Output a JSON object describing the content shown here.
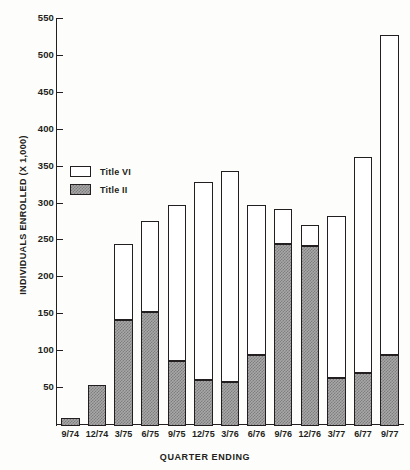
{
  "chart_data": {
    "type": "bar",
    "stacked": true,
    "title": "",
    "xlabel": "QUARTER ENDING",
    "ylabel": "INDIVIDUALS ENROLLED (X 1,000)",
    "ylim": [
      0,
      550
    ],
    "ytick_step": 50,
    "yticks": [
      0,
      50,
      100,
      150,
      200,
      250,
      300,
      350,
      400,
      450,
      500,
      550
    ],
    "ytick_labels": [
      "0",
      "50",
      "100",
      "150",
      "200",
      "250",
      "300",
      "350",
      "400",
      "450",
      "500",
      "550"
    ],
    "grid": false,
    "legend_position": "upper-left-inside",
    "categories": [
      "9/74",
      "12/74",
      "3/75",
      "6/75",
      "9/75",
      "12/75",
      "3/76",
      "6/76",
      "9/76",
      "12/76",
      "3/77",
      "6/77",
      "9/77"
    ],
    "series": [
      {
        "name": "Title II",
        "color": "#a8a8a8",
        "pattern": "hatched",
        "values": [
          11,
          56,
          144,
          154,
          88,
          63,
          60,
          96,
          246,
          244,
          65,
          72,
          96
        ]
      },
      {
        "name": "Title VI",
        "color": "#ffffff",
        "pattern": "solid",
        "values": [
          0,
          0,
          103,
          124,
          212,
          268,
          286,
          204,
          48,
          28,
          219,
          292,
          434
        ]
      }
    ],
    "totals": [
      11,
      56,
      247,
      278,
      300,
      331,
      346,
      300,
      294,
      272,
      284,
      364,
      530
    ]
  },
  "legend": {
    "items": [
      {
        "label": "Title VI",
        "swatch": "white"
      },
      {
        "label": "Title II",
        "swatch": "hatched"
      }
    ]
  },
  "colors": {
    "axis": "#231f20",
    "title_vi": "#ffffff",
    "title_ii": "#a8a8a8",
    "background": "#fdfdfb"
  }
}
